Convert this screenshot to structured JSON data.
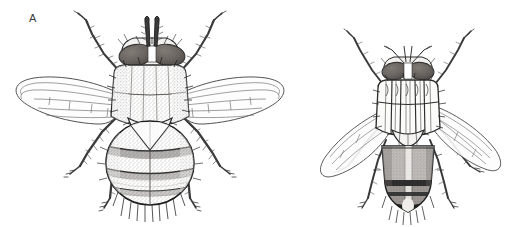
{
  "figure": {
    "width": 519,
    "height": 227,
    "background_color": "#ffffff",
    "style": "pen-and-ink scientific line drawing, stippled grayscale",
    "view": "dorsal"
  },
  "panels": [
    {
      "id": "a",
      "label": "A",
      "label_x": 33,
      "label_y": 18,
      "subject": "fly",
      "orientation": "dorsal",
      "description": "large fly with broadly outspread wings, stippled thorax and oval abdomen",
      "wing_posture": "outspread",
      "relative_size": "large"
    },
    {
      "id": "b",
      "label": "B",
      "label_x": 320,
      "label_y": 48,
      "subject": "fly",
      "orientation": "dorsal",
      "description": "smaller fly with swept-back wings, longitudinally striped thorax and gray banded abdomen",
      "wing_posture": "swept-back",
      "relative_size": "small"
    }
  ],
  "colors": {
    "background": "#ffffff",
    "ink": "#1a1a1a",
    "outline": "#2b2b2b",
    "eye_fill": "#6a6560",
    "eye_dark": "#4a4540",
    "body_stipple": "#8a8580",
    "abdomen_gray": "#9a9590",
    "band_dark": "#2e2e2e",
    "wing_vein": "#6b6b6b",
    "wing_fill": "#fdfdfd",
    "leg": "#3a3a3a",
    "label_text": "#3a3a3a"
  },
  "anatomy_labels": {
    "head": "head",
    "eye": "compound-eye",
    "antenna": "antenna",
    "thorax": "thorax",
    "scutellum": "scutellum",
    "abdomen": "abdomen",
    "wing": "wing",
    "halter": "halter",
    "leg": "leg",
    "bristles": "bristles"
  }
}
